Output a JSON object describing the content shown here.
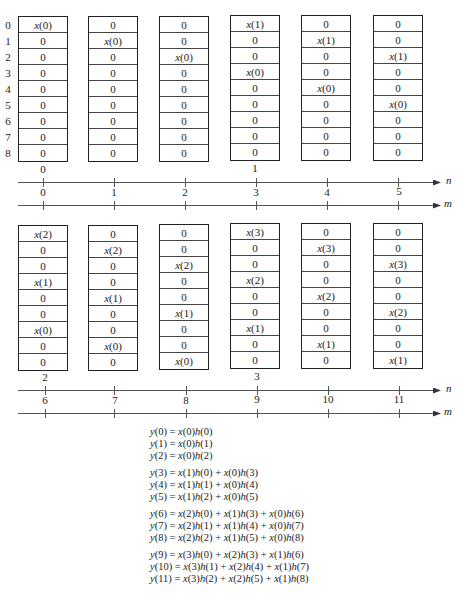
{
  "diagram": {
    "row_indices": [
      "0",
      "1",
      "2",
      "3",
      "4",
      "5",
      "6",
      "7",
      "8"
    ],
    "top_group": {
      "columns": [
        {
          "m": "0",
          "cells": [
            "x(0)",
            "0",
            "0",
            "0",
            "0",
            "0",
            "0",
            "0",
            "0"
          ]
        },
        {
          "m": "1",
          "cells": [
            "0",
            "x(0)",
            "0",
            "0",
            "0",
            "0",
            "0",
            "0",
            "0"
          ]
        },
        {
          "m": "2",
          "cells": [
            "0",
            "0",
            "x(0)",
            "0",
            "0",
            "0",
            "0",
            "0",
            "0"
          ]
        },
        {
          "m": "3",
          "cells": [
            "x(1)",
            "0",
            "0",
            "x(0)",
            "0",
            "0",
            "0",
            "0",
            "0"
          ]
        },
        {
          "m": "4",
          "cells": [
            "0",
            "x(1)",
            "0",
            "0",
            "x(0)",
            "0",
            "0",
            "0",
            "0"
          ]
        },
        {
          "m": "5",
          "cells": [
            "0",
            "0",
            "x(1)",
            "0",
            "0",
            "x(0)",
            "0",
            "0",
            "0"
          ]
        }
      ],
      "n_labels": [
        {
          "col": 0,
          "text": "0"
        },
        {
          "col": 3,
          "text": "1"
        }
      ],
      "n_axis_label": "n",
      "m_axis_label": "m"
    },
    "bottom_group": {
      "columns": [
        {
          "m": "6",
          "cells": [
            "x(2)",
            "0",
            "0",
            "x(1)",
            "0",
            "0",
            "x(0)",
            "0",
            "0"
          ]
        },
        {
          "m": "7",
          "cells": [
            "0",
            "x(2)",
            "0",
            "0",
            "x(1)",
            "0",
            "0",
            "x(0)",
            "0"
          ]
        },
        {
          "m": "8",
          "cells": [
            "0",
            "0",
            "x(2)",
            "0",
            "0",
            "x(1)",
            "0",
            "0",
            "x(0)"
          ]
        },
        {
          "m": "9",
          "cells": [
            "x(3)",
            "0",
            "0",
            "x(2)",
            "0",
            "0",
            "x(1)",
            "0",
            "0"
          ]
        },
        {
          "m": "10",
          "cells": [
            "0",
            "x(3)",
            "0",
            "0",
            "x(2)",
            "0",
            "0",
            "x(1)",
            "0"
          ]
        },
        {
          "m": "11",
          "cells": [
            "0",
            "0",
            "x(3)",
            "0",
            "0",
            "x(2)",
            "0",
            "0",
            "x(1)"
          ]
        }
      ],
      "n_labels": [
        {
          "col": 0,
          "text": "2"
        },
        {
          "col": 3,
          "text": "3"
        }
      ],
      "n_axis_label": "n",
      "m_axis_label": "m"
    },
    "equations": [
      [
        "y(0) = x(0)h(0)",
        "y(1) = x(0)h(1)",
        "y(2) = x(0)h(2)"
      ],
      [
        "y(3) = x(1)h(0) + x(0)h(3)",
        "y(4) = x(1)h(1) + x(0)h(4)",
        "y(5) = x(1)h(2) + x(0)h(5)"
      ],
      [
        "y(6) = x(2)h(0) + x(1)h(3) + x(0)h(6)",
        "y(7) = x(2)h(1) + x(1)h(4) + x(0)h(7)",
        "y(8) = x(2)h(2) + x(1)h(5) + x(0)h(8)"
      ],
      [
        "y(9) = x(3)h(0) + x(2)h(3) + x(1)h(6)",
        "y(10) = x(3)h(1) + x(2)h(4) + x(1)h(7)",
        "y(11) = x(3)h(2) + x(2)h(5) + x(1)h(8)"
      ]
    ]
  }
}
